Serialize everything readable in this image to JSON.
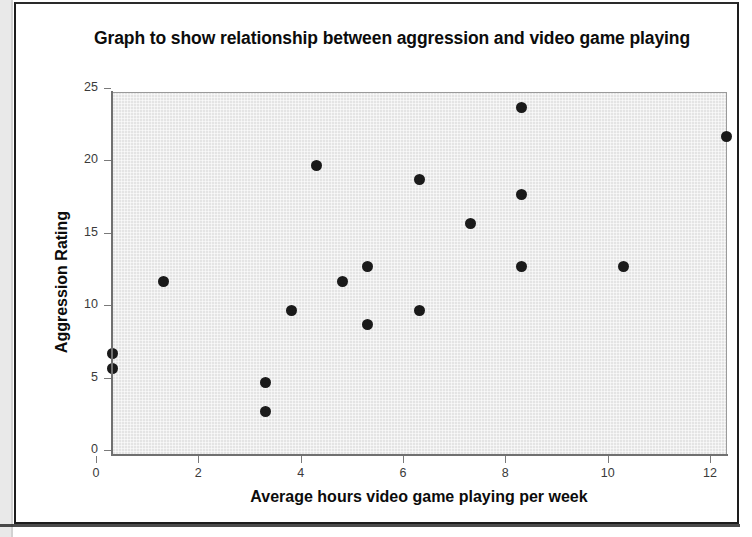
{
  "chart_data": {
    "type": "scatter",
    "title": "Graph to show relationship between aggression and video game playing",
    "xlabel": "Average hours video game playing per week",
    "ylabel": "Aggression Rating",
    "xlim": [
      0,
      12
    ],
    "ylim": [
      0,
      25
    ],
    "xticks": [
      "0",
      "2",
      "4",
      "6",
      "8",
      "10",
      "12"
    ],
    "xtick_values": [
      0,
      2,
      4,
      6,
      8,
      10,
      12
    ],
    "yticks": [
      "0",
      "5",
      "10",
      "15",
      "20",
      "25"
    ],
    "ytick_values": [
      0,
      5,
      10,
      15,
      20,
      25
    ],
    "grid": false,
    "legend": null,
    "marker_color": "#1a1a1a",
    "plot_background": "#e4e4e4",
    "points": [
      {
        "x": 0,
        "y": 7
      },
      {
        "x": 0,
        "y": 6
      },
      {
        "x": 1,
        "y": 12
      },
      {
        "x": 3,
        "y": 5
      },
      {
        "x": 3,
        "y": 3
      },
      {
        "x": 3.5,
        "y": 10
      },
      {
        "x": 4,
        "y": 20
      },
      {
        "x": 4.5,
        "y": 12
      },
      {
        "x": 5,
        "y": 13
      },
      {
        "x": 5,
        "y": 9
      },
      {
        "x": 6,
        "y": 19
      },
      {
        "x": 6,
        "y": 10
      },
      {
        "x": 7,
        "y": 16
      },
      {
        "x": 8,
        "y": 24
      },
      {
        "x": 8,
        "y": 18
      },
      {
        "x": 8,
        "y": 13
      },
      {
        "x": 10,
        "y": 13
      },
      {
        "x": 12,
        "y": 22
      }
    ]
  }
}
